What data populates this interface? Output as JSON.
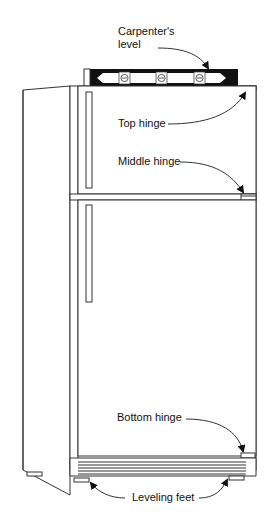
{
  "diagram": {
    "labels": {
      "carpenters_level_line1": "Carpenter's",
      "carpenters_level_line2": "level",
      "top_hinge": "Top hinge",
      "middle_hinge": "Middle hinge",
      "bottom_hinge": "Bottom hinge",
      "leveling_feet": "Leveling feet"
    },
    "colors": {
      "line": "#333333",
      "level_body": "#111111",
      "background": "#ffffff"
    }
  }
}
